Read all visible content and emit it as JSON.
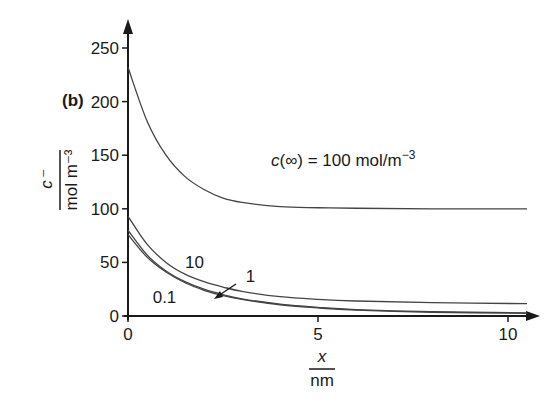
{
  "chart_data": {
    "type": "line",
    "panel_label": "(b)",
    "title": "",
    "xlabel": "x / nm",
    "xlabel_num": "x",
    "xlabel_den": "nm",
    "ylabel": "c⁻ / mol m⁻³",
    "ylabel_num": "c⁻",
    "ylabel_den": "mol m⁻³",
    "xlim": [
      0,
      10.5
    ],
    "ylim": [
      0,
      270
    ],
    "xticks": [
      0,
      5,
      10
    ],
    "yticks": [
      0,
      50,
      100,
      150,
      200,
      250
    ],
    "grid": false,
    "annotation": "c(∞) = 100 mol/m⁻³",
    "annotation_parts": {
      "c": "c",
      "rest": "(∞) = 100 mol/m",
      "sup": "−3"
    },
    "series": [
      {
        "name": "c(∞) = 100",
        "label": "",
        "x": [
          0,
          0.5,
          1,
          1.5,
          2,
          2.5,
          3,
          4,
          5,
          6,
          8,
          10.5
        ],
        "y": [
          232,
          182,
          150,
          130,
          118,
          110,
          106,
          102,
          101,
          100.5,
          100,
          100
        ]
      },
      {
        "name": "10",
        "label": "10",
        "x": [
          0,
          0.5,
          1,
          1.5,
          2,
          2.5,
          3,
          4,
          5,
          6,
          8,
          10.5
        ],
        "y": [
          93,
          67,
          50,
          39,
          32,
          27,
          23,
          18,
          15.5,
          14,
          12.5,
          11.5
        ]
      },
      {
        "name": "1",
        "label": "1",
        "x": [
          0,
          0.5,
          1,
          1.5,
          2,
          2.5,
          3,
          4,
          5,
          6,
          8,
          10.5
        ],
        "y": [
          80,
          57,
          42,
          32,
          25,
          20,
          16,
          11,
          8,
          6,
          4,
          3
        ]
      },
      {
        "name": "0.1",
        "label": "0.1",
        "x": [
          0,
          0.5,
          1,
          1.5,
          2,
          2.5,
          3,
          4,
          5,
          6,
          8,
          10.5
        ],
        "y": [
          76,
          55,
          41,
          31,
          24,
          19,
          15.5,
          10.5,
          7.5,
          5.5,
          3.5,
          2.5
        ]
      }
    ],
    "curve_labels": [
      {
        "text": "10",
        "x": 1.5,
        "y": 45
      },
      {
        "text": "1",
        "x": 3.1,
        "y": 32
      },
      {
        "text": "0.1",
        "x": 0.65,
        "y": 12
      }
    ]
  }
}
